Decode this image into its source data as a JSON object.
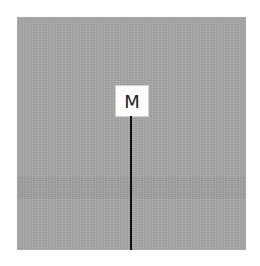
{
  "marker": {
    "label": "M",
    "line_color": "#111111"
  },
  "panel": {
    "background_color": "#a7a7a7"
  }
}
